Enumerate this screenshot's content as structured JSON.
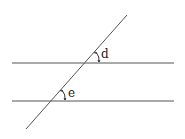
{
  "diagram": {
    "lines": {
      "parallel_top": {
        "x1": 12,
        "y1": 63,
        "x2": 174,
        "y2": 63
      },
      "parallel_bottom": {
        "x1": 12,
        "y1": 101,
        "x2": 174,
        "y2": 101
      },
      "transversal": {
        "x1": 127,
        "y1": 15,
        "x2": 26,
        "y2": 129
      }
    },
    "angles": [
      {
        "label": "d",
        "vertex": [
          88,
          63
        ],
        "label_pos": [
          101,
          57
        ]
      },
      {
        "label": "e",
        "vertex": [
          54,
          101
        ],
        "label_pos": [
          68,
          95
        ]
      }
    ],
    "colors": {
      "line": "#555555",
      "text": "#222222",
      "background": "#ffffff"
    }
  }
}
